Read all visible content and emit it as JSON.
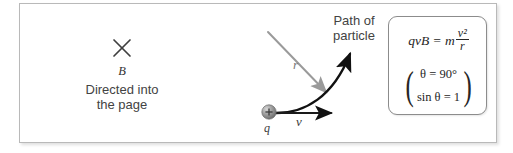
{
  "figure": {
    "background_color": "#ffffff",
    "frame_border_color": "#b9b9b9",
    "ink_color": "#3a3a3a"
  },
  "magnetic_field": {
    "symbol_icon": "x-cross-icon",
    "symbol_label": "B",
    "caption_line_1": "Directed into",
    "caption_line_2": "the page",
    "caption": "Directed into\nthe page"
  },
  "particle": {
    "charge_label": "q",
    "charge_sign": "+",
    "sphere_color": "#8d8d8d"
  },
  "vectors": {
    "velocity_label": "v",
    "velocity_color": "#1a1a1a",
    "radius_label": "r",
    "radius_color": "#9a9a9a",
    "path_color": "#111111"
  },
  "path_callout": {
    "line_1": "Path of",
    "line_2": "particle",
    "text": "Path of\nparticle"
  },
  "equation_box": {
    "border_color": "#8c8c8c",
    "main_lhs": "qvB = m",
    "fraction_numerator": "v²",
    "fraction_denominator": "r",
    "main_equation": "qvB = m v²/r",
    "condition_1": "θ = 90°",
    "condition_2": "sin θ = 1",
    "left_paren": "(",
    "right_paren": ")"
  }
}
